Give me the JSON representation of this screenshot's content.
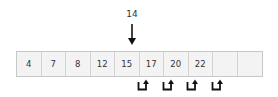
{
  "insert": {
    "value": "14",
    "target_index": 5
  },
  "array": {
    "cells": [
      "4",
      "7",
      "8",
      "12",
      "15",
      "17",
      "20",
      "22",
      "",
      ""
    ]
  },
  "shift_arrows": [
    {
      "from_index": 5,
      "to_index": 6
    },
    {
      "from_index": 6,
      "to_index": 7
    },
    {
      "from_index": 7,
      "to_index": 8
    },
    {
      "from_index": 8,
      "to_index": 9
    }
  ],
  "colors": {
    "cell_bg": "#f3f3f3",
    "cell_border": "#d2d2d2",
    "text": "#333333",
    "arrow": "#111111"
  }
}
